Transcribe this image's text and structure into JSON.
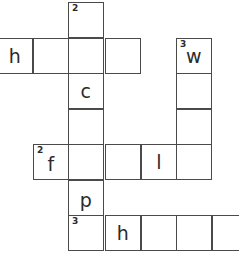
{
  "puzzle": {
    "type": "crossword-grid",
    "title": "Crossword puzzle grid",
    "geometry": {
      "cell_size": 35.7,
      "col_x": [
        -3,
        33,
        68,
        105,
        141,
        176,
        212
      ],
      "row_y": [
        2,
        38,
        73,
        109,
        144,
        180,
        215
      ],
      "border_color": "#4a4a4a",
      "cell_fill": "#ffffff",
      "text_color": "#2b2b2b"
    },
    "cells": [
      {
        "id": "c-r0-2",
        "col": 2,
        "row": 0,
        "letter": "",
        "clue_number": "2"
      },
      {
        "id": "c-r1-0",
        "col": 0,
        "row": 1,
        "letter": "h",
        "clue_number": ""
      },
      {
        "id": "c-r1-1",
        "col": 1,
        "row": 1,
        "letter": "",
        "clue_number": ""
      },
      {
        "id": "c-r1-2",
        "col": 2,
        "row": 1,
        "letter": "",
        "clue_number": ""
      },
      {
        "id": "c-r1-3",
        "col": 3,
        "row": 1,
        "letter": "",
        "clue_number": ""
      },
      {
        "id": "c-r1-5",
        "col": 5,
        "row": 1,
        "letter": "w",
        "clue_number": "3"
      },
      {
        "id": "c-r2-2",
        "col": 2,
        "row": 2,
        "letter": "c",
        "clue_number": ""
      },
      {
        "id": "c-r2-5",
        "col": 5,
        "row": 2,
        "letter": "",
        "clue_number": ""
      },
      {
        "id": "c-r3-2",
        "col": 2,
        "row": 3,
        "letter": "",
        "clue_number": ""
      },
      {
        "id": "c-r3-5",
        "col": 5,
        "row": 3,
        "letter": "",
        "clue_number": ""
      },
      {
        "id": "c-r4-1",
        "col": 1,
        "row": 4,
        "letter": "f",
        "clue_number": "2"
      },
      {
        "id": "c-r4-2",
        "col": 2,
        "row": 4,
        "letter": "",
        "clue_number": ""
      },
      {
        "id": "c-r4-3",
        "col": 3,
        "row": 4,
        "letter": "",
        "clue_number": ""
      },
      {
        "id": "c-r4-4",
        "col": 4,
        "row": 4,
        "letter": "l",
        "clue_number": ""
      },
      {
        "id": "c-r4-5",
        "col": 5,
        "row": 4,
        "letter": "",
        "clue_number": ""
      },
      {
        "id": "c-r5-2",
        "col": 2,
        "row": 5,
        "letter": "p",
        "clue_number": ""
      },
      {
        "id": "c-r6-2",
        "col": 2,
        "row": 6,
        "letter": "",
        "clue_number": "3"
      },
      {
        "id": "c-r6-3",
        "col": 3,
        "row": 6,
        "letter": "h",
        "clue_number": ""
      },
      {
        "id": "c-r6-4",
        "col": 4,
        "row": 6,
        "letter": "",
        "clue_number": ""
      },
      {
        "id": "c-r6-5",
        "col": 5,
        "row": 6,
        "letter": "",
        "clue_number": ""
      },
      {
        "id": "c-r6-6",
        "col": 6,
        "row": 6,
        "letter": "",
        "clue_number": ""
      }
    ]
  }
}
